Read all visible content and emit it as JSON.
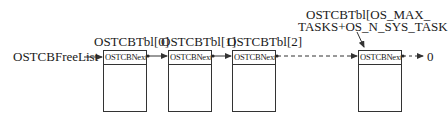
{
  "diagram": {
    "type": "linked-list",
    "head_label": "OSTCBFreeList",
    "nodes": [
      {
        "label": "OSTCBTbl[0]",
        "field": "OSTCBNext"
      },
      {
        "label": "OSTCBTbl[1]",
        "field": "OSTCBNext"
      },
      {
        "label": "OSTCBTbl[2]",
        "field": "OSTCBNext"
      },
      {
        "label_line1": "OSTCBTbl[OS_MAX_",
        "label_line2": "TASKS+OS_N_SYS_TASK",
        "field": "OSTCBNext"
      }
    ],
    "terminator": "0",
    "colors": {
      "line": "#333333",
      "text": "#1a1a1a",
      "background": "#ffffff"
    }
  }
}
